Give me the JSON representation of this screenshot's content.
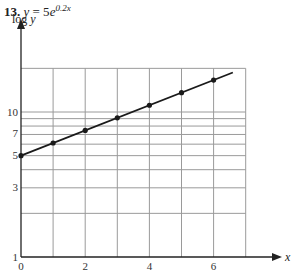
{
  "problem_number": "13.",
  "title_lhs": "y",
  "title_eq": " = 5",
  "title_base": "e",
  "title_exp": "0.2x",
  "chart_data": {
    "type": "line",
    "xlabel": "x",
    "ylabel": "log y",
    "yscale": "log",
    "xlim": [
      0,
      7
    ],
    "ylim": [
      1,
      25
    ],
    "x_ticks": [
      0,
      2,
      4,
      6
    ],
    "y_ticks": [
      1,
      3,
      5,
      7,
      10
    ],
    "y_gridlines": [
      2,
      3,
      4,
      5,
      6,
      7,
      8,
      9,
      10,
      20
    ],
    "x_gridlines": [
      1,
      2,
      3,
      4,
      5,
      6,
      7
    ],
    "grid": true,
    "series": [
      {
        "name": "y = 5e^{0.2x}",
        "x": [
          0,
          1,
          2,
          3,
          4,
          5,
          6
        ],
        "y": [
          5.0,
          6.11,
          7.46,
          9.11,
          11.13,
          13.59,
          16.6
        ],
        "line_extends_to_x": 6.6,
        "markers": true
      }
    ]
  },
  "colors": {
    "grid": "#9a9a9a",
    "axis": "#222222",
    "line": "#1a1a1a"
  }
}
